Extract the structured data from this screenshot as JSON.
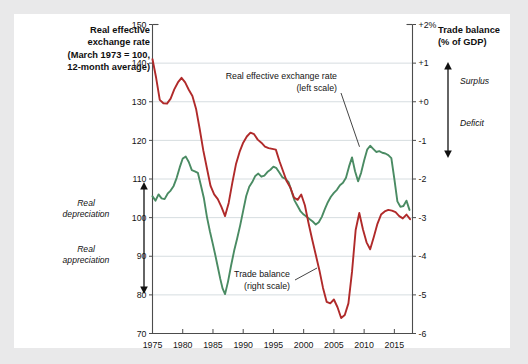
{
  "left_header": {
    "lines": [
      "Real effective",
      "exchange rate",
      "(March 1973 = 100,",
      "12-month average)"
    ]
  },
  "right_header": {
    "lines": [
      "Trade balance",
      "(% of GDP)"
    ]
  },
  "left_arrow_labels": {
    "up": "Real\ndepreciation",
    "up_line1": "Real",
    "up_line2": "depreciation",
    "down_line1": "Real",
    "down_line2": "appreciation"
  },
  "right_arrow_labels": {
    "up": "Surplus",
    "down": "Deficit"
  },
  "colors": {
    "exchange_rate_line": "#4a8b63",
    "trade_balance_line": "#b02a2a",
    "grid": "#d6dde0",
    "axis": "#4c4c4c",
    "card_bg": "#ffffff",
    "page_bg": "#e9e9ea",
    "text": "#111111"
  },
  "chart_data": {
    "type": "line",
    "title": "",
    "subtitle": "",
    "xlabel": "",
    "grid": true,
    "legend": "annotation",
    "xlim": [
      1975,
      2018
    ],
    "xticks": [
      1975,
      1980,
      1985,
      1990,
      1995,
      2000,
      2005,
      2010,
      2015
    ],
    "xtick_labels": [
      "1975",
      "1980",
      "1985",
      "1990",
      "1995",
      "2000",
      "2005",
      "2010",
      "2015"
    ],
    "left_axis": {
      "label": "Real effective exchange rate (March 1973 = 100, 12-month average)",
      "ylim": [
        70,
        150
      ],
      "yticks": [
        70,
        80,
        90,
        100,
        110,
        120,
        130,
        140,
        150
      ],
      "ytick_labels": [
        "70",
        "80",
        "90",
        "100",
        "110",
        "120",
        "130",
        "140",
        "150"
      ]
    },
    "right_axis": {
      "label": "Trade balance (% of GDP)",
      "ylim": [
        -6,
        2
      ],
      "yticks": [
        -6,
        -5,
        -4,
        -3,
        -2,
        -1,
        0,
        1,
        2
      ],
      "ytick_labels": [
        "-6",
        "-5",
        "-4",
        "-3",
        "-2",
        "-1",
        "+0",
        "+1",
        "+2%"
      ]
    },
    "annotations": [
      {
        "name": "exchange-rate-callout",
        "lines": [
          "Real effective exchange rate",
          "(left scale)"
        ],
        "points_to_series": "Real effective exchange rate",
        "points_to": [
          2009.4,
          118.6
        ]
      },
      {
        "name": "trade-balance-callout",
        "lines": [
          "Trade balance",
          "(right scale)"
        ],
        "points_to_series": "Trade balance",
        "points_to": [
          2003.4,
          -5.3
        ]
      }
    ],
    "series": [
      {
        "name": "Real effective exchange rate",
        "axis": "left",
        "color": "#4a8b63",
        "unit": "index (March 1973 = 100)",
        "x": [
          1975.0,
          1975.5,
          1976.0,
          1976.5,
          1977.0,
          1977.5,
          1978.0,
          1978.5,
          1979.0,
          1979.5,
          1980.0,
          1980.5,
          1981.0,
          1981.5,
          1982.0,
          1982.5,
          1983.0,
          1983.5,
          1984.0,
          1984.5,
          1985.0,
          1985.4,
          1985.8,
          1986.2,
          1986.6,
          1987.0,
          1987.5,
          1988.0,
          1988.5,
          1989.0,
          1989.5,
          1990.0,
          1990.5,
          1991.0,
          1991.5,
          1992.0,
          1992.5,
          1993.0,
          1993.5,
          1994.0,
          1994.5,
          1995.0,
          1995.5,
          1996.0,
          1996.5,
          1997.0,
          1997.5,
          1998.0,
          1998.5,
          1999.0,
          1999.5,
          2000.0,
          2000.5,
          2001.0,
          2001.5,
          2002.0,
          2002.5,
          2003.0,
          2003.5,
          2004.0,
          2004.5,
          2005.0,
          2005.5,
          2006.0,
          2006.5,
          2007.0,
          2007.5,
          2008.0,
          2008.5,
          2009.0,
          2009.5,
          2010.0,
          2010.5,
          2011.0,
          2011.5,
          2012.0,
          2012.5,
          2013.0,
          2013.5,
          2014.0,
          2014.5,
          2015.0,
          2015.5,
          2016.0,
          2016.5,
          2017.0,
          2017.5
        ],
        "y": [
          105.5,
          104.4,
          106.0,
          105.0,
          104.8,
          106.2,
          107.0,
          108.2,
          110.3,
          113.0,
          115.3,
          115.8,
          114.4,
          112.3,
          112.0,
          111.6,
          108.4,
          105.0,
          100.2,
          96.4,
          93.0,
          90.2,
          87.2,
          84.2,
          81.6,
          80.2,
          83.5,
          87.6,
          91.4,
          94.6,
          98.0,
          101.8,
          105.6,
          108.0,
          109.2,
          110.8,
          111.4,
          110.6,
          110.9,
          111.8,
          112.4,
          113.2,
          112.8,
          111.6,
          110.4,
          110.0,
          109.2,
          106.8,
          104.4,
          103.0,
          101.6,
          100.8,
          100.2,
          99.6,
          99.0,
          98.2,
          98.8,
          100.2,
          102.2,
          104.0,
          105.4,
          106.4,
          107.2,
          108.4,
          109.0,
          110.3,
          113.2,
          115.6,
          112.0,
          109.4,
          111.6,
          114.8,
          117.6,
          118.6,
          117.8,
          117.0,
          117.2,
          116.8,
          116.6,
          116.2,
          115.4,
          110.0,
          104.2,
          102.8,
          103.0,
          104.4,
          102.0
        ]
      },
      {
        "name": "Trade balance",
        "axis": "right",
        "color": "#b02a2a",
        "unit": "% of GDP",
        "x": [
          1975.0,
          1975.6,
          1976.2,
          1976.8,
          1977.4,
          1978.0,
          1978.6,
          1979.2,
          1979.8,
          1980.4,
          1981.0,
          1981.6,
          1982.2,
          1982.8,
          1983.4,
          1984.0,
          1984.6,
          1985.2,
          1985.8,
          1986.4,
          1987.0,
          1987.6,
          1988.2,
          1988.8,
          1989.4,
          1990.0,
          1990.6,
          1991.2,
          1991.8,
          1992.4,
          1993.0,
          1993.6,
          1994.2,
          1994.8,
          1995.4,
          1996.0,
          1996.6,
          1997.2,
          1997.8,
          1998.4,
          1999.0,
          1999.6,
          2000.2,
          2000.8,
          2001.4,
          2002.0,
          2002.6,
          2003.2,
          2003.8,
          2004.4,
          2005.0,
          2005.6,
          2006.2,
          2006.8,
          2007.4,
          2008.0,
          2008.6,
          2009.2,
          2009.8,
          2010.4,
          2011.0,
          2011.6,
          2012.2,
          2012.8,
          2013.4,
          2014.0,
          2014.6,
          2015.2,
          2015.8,
          2016.4,
          2017.0,
          2017.6
        ],
        "y": [
          1.1,
          0.62,
          0.05,
          -0.04,
          -0.05,
          0.08,
          0.32,
          0.5,
          0.62,
          0.5,
          0.31,
          0.15,
          -0.18,
          -0.7,
          -1.26,
          -1.72,
          -2.18,
          -2.4,
          -2.52,
          -2.72,
          -2.96,
          -2.62,
          -2.1,
          -1.62,
          -1.3,
          -1.06,
          -0.9,
          -0.8,
          -0.84,
          -0.98,
          -1.06,
          -1.16,
          -1.2,
          -1.22,
          -1.24,
          -1.54,
          -1.8,
          -2.06,
          -2.22,
          -2.48,
          -2.54,
          -2.4,
          -2.68,
          -3.14,
          -3.56,
          -3.96,
          -4.36,
          -4.82,
          -5.18,
          -5.22,
          -5.12,
          -5.32,
          -5.6,
          -5.52,
          -5.22,
          -4.4,
          -3.32,
          -2.88,
          -3.3,
          -3.64,
          -3.82,
          -3.5,
          -3.16,
          -2.92,
          -2.84,
          -2.8,
          -2.82,
          -2.86,
          -2.96,
          -3.02,
          -2.92,
          -3.04
        ]
      }
    ]
  }
}
